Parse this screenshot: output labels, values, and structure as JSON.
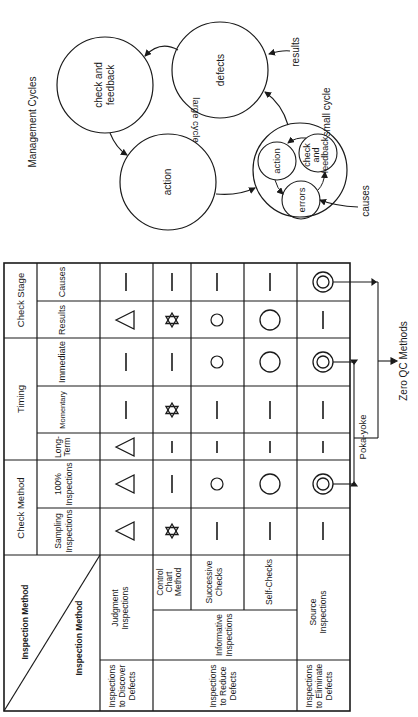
{
  "cycles": {
    "title": "Management Cycles",
    "large_cycle_label": "large cycle",
    "small_cycle_label": "small cycle",
    "large": {
      "check": [
        "check and",
        "feedback"
      ],
      "action": "action",
      "defects": "defects"
    },
    "small": {
      "action": "action",
      "check": [
        "check",
        "and",
        "feedback"
      ],
      "errors": "errors"
    },
    "inputs": {
      "results": "results",
      "causes": "causes"
    }
  },
  "table": {
    "corner_top": "Inspection Method",
    "corner_bottom": "Inspection Method",
    "groups": {
      "check_method": "Check Method",
      "timing": "Timing",
      "check_stage": "Check Stage"
    },
    "columns": {
      "sampling": [
        "Sampling",
        "Inspections"
      ],
      "hundred": [
        "100%",
        "Inspections"
      ],
      "long_term": [
        "Long-",
        "Term"
      ],
      "momentary": "Momentary",
      "immediate": "Immediate",
      "results": "Results",
      "causes": "Causes"
    },
    "rows": {
      "discover": [
        "Inspections",
        "to Discover",
        "Defects"
      ],
      "judgment": [
        "Judgment",
        "Inspections"
      ],
      "reduce": [
        "Inspections",
        "to Reduce",
        "Defects"
      ],
      "informative": [
        "Informative",
        "Inspections"
      ],
      "control_chart": [
        "Control",
        "Chart",
        "Method"
      ],
      "successive": [
        "Successive",
        "Checks"
      ],
      "self_checks": "Self-Checks",
      "eliminate": [
        "Inspections",
        "to Eliminate",
        "Defects"
      ],
      "source": [
        "Source",
        "Inspections"
      ]
    },
    "symbols_legend": {
      "triangle": "triangle",
      "star": "six-point star",
      "small_circle": "small circle",
      "large_circle": "large circle",
      "double_circle": "double circle",
      "dash": "not applicable"
    },
    "matrix": {
      "column_order": [
        "sampling",
        "hundred",
        "long_term",
        "momentary",
        "immediate",
        "results",
        "causes"
      ],
      "judgment": [
        "triangle",
        "triangle",
        "triangle",
        "dash",
        "dash",
        "triangle",
        "dash"
      ],
      "control_chart": [
        "star",
        "dash",
        "dash",
        "star",
        "dash",
        "star",
        "dash"
      ],
      "successive": [
        "dash",
        "small_circle",
        "dash",
        "dash",
        "small_circle",
        "small_circle",
        "dash"
      ],
      "self_checks": [
        "dash",
        "large_circle",
        "dash",
        "dash",
        "large_circle",
        "large_circle",
        "dash"
      ],
      "source": [
        "dash",
        "double_circle",
        "dash",
        "dash",
        "double_circle",
        "dash",
        "double_circle"
      ]
    }
  },
  "annotations": {
    "poka_yoke": "Poka-yoke",
    "zero_qc": "Zero QC Methods"
  }
}
